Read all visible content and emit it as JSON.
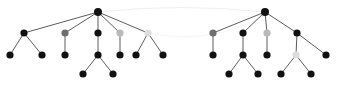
{
  "figure": {
    "width": 347,
    "height": 89,
    "background_color": "#ffffff"
  },
  "style": {
    "node_black": "#111111",
    "node_gray_mid": "#6e6e6e",
    "node_gray_light": "#b9b9b9",
    "node_gray_pale": "#dcdcdc",
    "edge_color": "#4a4a4a",
    "edge_width": 0.9,
    "arc_color": "#efefef",
    "arc_width": 1.0,
    "node_radius_root": 4.0,
    "node_radius": 3.6
  },
  "chart_data": {
    "type": "diagram",
    "graphs": [
      {
        "name": "left-tree",
        "root_id": "L0",
        "nodes": [
          {
            "id": "L0",
            "x": 98,
            "y": 12,
            "color": "#111111",
            "shade": "black",
            "level": 0,
            "radius": 4.0
          },
          {
            "id": "L1",
            "x": 24,
            "y": 33,
            "color": "#111111",
            "shade": "black",
            "level": 1,
            "radius": 3.6
          },
          {
            "id": "L2",
            "x": 65,
            "y": 33,
            "color": "#6e6e6e",
            "shade": "gray-mid",
            "level": 1,
            "radius": 3.6
          },
          {
            "id": "L3",
            "x": 98,
            "y": 33,
            "color": "#111111",
            "shade": "black",
            "level": 1,
            "radius": 3.6
          },
          {
            "id": "L4",
            "x": 120,
            "y": 33,
            "color": "#b9b9b9",
            "shade": "gray-light",
            "level": 1,
            "radius": 3.6
          },
          {
            "id": "L5",
            "x": 148,
            "y": 33,
            "color": "#dcdcdc",
            "shade": "gray-pale",
            "level": 1,
            "radius": 3.6
          },
          {
            "id": "L6",
            "x": 10,
            "y": 55,
            "color": "#111111",
            "shade": "black",
            "level": 2,
            "radius": 3.6
          },
          {
            "id": "L7",
            "x": 42,
            "y": 55,
            "color": "#111111",
            "shade": "black",
            "level": 2,
            "radius": 3.6
          },
          {
            "id": "L8",
            "x": 65,
            "y": 55,
            "color": "#111111",
            "shade": "black",
            "level": 2,
            "radius": 3.6
          },
          {
            "id": "L9",
            "x": 98,
            "y": 55,
            "color": "#111111",
            "shade": "black",
            "level": 2,
            "radius": 3.6
          },
          {
            "id": "L10",
            "x": 120,
            "y": 55,
            "color": "#111111",
            "shade": "black",
            "level": 2,
            "radius": 3.6
          },
          {
            "id": "L11",
            "x": 136,
            "y": 55,
            "color": "#111111",
            "shade": "black",
            "level": 2,
            "radius": 3.6
          },
          {
            "id": "L12",
            "x": 163,
            "y": 55,
            "color": "#111111",
            "shade": "black",
            "level": 2,
            "radius": 3.6
          },
          {
            "id": "L13",
            "x": 83,
            "y": 74,
            "color": "#111111",
            "shade": "black",
            "level": 3,
            "radius": 3.6
          },
          {
            "id": "L14",
            "x": 113,
            "y": 74,
            "color": "#111111",
            "shade": "black",
            "level": 3,
            "radius": 3.6
          }
        ],
        "edges": [
          {
            "from": "L0",
            "to": "L1"
          },
          {
            "from": "L0",
            "to": "L2"
          },
          {
            "from": "L0",
            "to": "L3"
          },
          {
            "from": "L0",
            "to": "L4"
          },
          {
            "from": "L0",
            "to": "L5"
          },
          {
            "from": "L1",
            "to": "L6"
          },
          {
            "from": "L1",
            "to": "L7"
          },
          {
            "from": "L2",
            "to": "L8"
          },
          {
            "from": "L3",
            "to": "L9"
          },
          {
            "from": "L4",
            "to": "L10"
          },
          {
            "from": "L5",
            "to": "L11"
          },
          {
            "from": "L5",
            "to": "L12"
          },
          {
            "from": "L9",
            "to": "L13"
          },
          {
            "from": "L9",
            "to": "L14"
          }
        ]
      },
      {
        "name": "right-tree",
        "root_id": "R0",
        "nodes": [
          {
            "id": "R0",
            "x": 265,
            "y": 12,
            "color": "#111111",
            "shade": "black",
            "level": 0,
            "radius": 4.0
          },
          {
            "id": "R1",
            "x": 213,
            "y": 33,
            "color": "#6e6e6e",
            "shade": "gray-mid",
            "level": 1,
            "radius": 3.6
          },
          {
            "id": "R2",
            "x": 243,
            "y": 33,
            "color": "#111111",
            "shade": "black",
            "level": 1,
            "radius": 3.6
          },
          {
            "id": "R3",
            "x": 267,
            "y": 33,
            "color": "#b9b9b9",
            "shade": "gray-light",
            "level": 1,
            "radius": 3.6
          },
          {
            "id": "R4",
            "x": 297,
            "y": 33,
            "color": "#111111",
            "shade": "black",
            "level": 1,
            "radius": 3.6
          },
          {
            "id": "R5",
            "x": 213,
            "y": 55,
            "color": "#111111",
            "shade": "black",
            "level": 2,
            "radius": 3.6
          },
          {
            "id": "R6",
            "x": 243,
            "y": 55,
            "color": "#111111",
            "shade": "black",
            "level": 2,
            "radius": 3.6
          },
          {
            "id": "R7",
            "x": 267,
            "y": 55,
            "color": "#111111",
            "shade": "black",
            "level": 2,
            "radius": 3.6
          },
          {
            "id": "R8",
            "x": 296,
            "y": 55,
            "color": "#dcdcdc",
            "shade": "gray-pale",
            "level": 2,
            "radius": 3.6
          },
          {
            "id": "R9",
            "x": 326,
            "y": 55,
            "color": "#111111",
            "shade": "black",
            "level": 2,
            "radius": 3.6
          },
          {
            "id": "R10",
            "x": 229,
            "y": 74,
            "color": "#111111",
            "shade": "black",
            "level": 3,
            "radius": 3.6
          },
          {
            "id": "R11",
            "x": 258,
            "y": 74,
            "color": "#111111",
            "shade": "black",
            "level": 3,
            "radius": 3.6
          },
          {
            "id": "R12",
            "x": 281,
            "y": 74,
            "color": "#111111",
            "shade": "black",
            "level": 3,
            "radius": 3.6
          },
          {
            "id": "R13",
            "x": 311,
            "y": 74,
            "color": "#111111",
            "shade": "black",
            "level": 3,
            "radius": 3.6
          }
        ],
        "edges": [
          {
            "from": "R0",
            "to": "R1"
          },
          {
            "from": "R0",
            "to": "R2"
          },
          {
            "from": "R0",
            "to": "R3"
          },
          {
            "from": "R0",
            "to": "R4"
          },
          {
            "from": "R1",
            "to": "R5"
          },
          {
            "from": "R2",
            "to": "R6"
          },
          {
            "from": "R3",
            "to": "R7"
          },
          {
            "from": "R4",
            "to": "R8"
          },
          {
            "from": "R4",
            "to": "R9"
          },
          {
            "from": "R6",
            "to": "R10"
          },
          {
            "from": "R6",
            "to": "R11"
          },
          {
            "from": "R8",
            "to": "R12"
          },
          {
            "from": "R8",
            "to": "R13"
          }
        ]
      }
    ],
    "arcs": [
      {
        "name": "root-link-arc",
        "from": "L0",
        "to": "R0",
        "x1": 98,
        "y1": 12,
        "x2": 265,
        "y2": 12,
        "curvature": -9,
        "color": "#efefef"
      },
      {
        "name": "lower-link-arc",
        "from": "L0",
        "to": "R0",
        "x1": 98,
        "y1": 14,
        "x2": 265,
        "y2": 16,
        "curvature": 44,
        "color": "#f4f4f4"
      }
    ]
  }
}
